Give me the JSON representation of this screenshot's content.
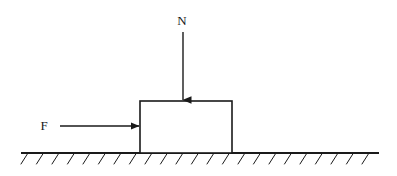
{
  "diagram": {
    "kind": "free-body-diagram",
    "background_color": "#ffffff",
    "stroke_color": "#1a1a1a",
    "labels": {
      "normal_force": "N",
      "applied_force": "F"
    },
    "block": {
      "name": "block",
      "x": 140,
      "y": 101,
      "width": 92,
      "height": 52,
      "fill": "#ffffff",
      "stroke_width": 1.6
    },
    "ground": {
      "name": "ground-line",
      "x_start": 22,
      "x_end": 378,
      "y": 153,
      "stroke_width": 2.0,
      "hatch": {
        "count": 23,
        "spacing": 15.5,
        "length": 13,
        "dx": -7,
        "dy": 11,
        "stroke_width": 1.0
      }
    },
    "arrows": [
      {
        "name": "normal-force-arrow",
        "label": "N",
        "direction": "down",
        "x1": 183,
        "y1": 32,
        "x2": 183,
        "y2": 100,
        "stroke_width": 1.4,
        "label_x": 182,
        "label_y": 25
      },
      {
        "name": "applied-force-arrow",
        "label": "F",
        "direction": "right",
        "x1": 60,
        "y1": 126,
        "x2": 139,
        "y2": 126,
        "stroke_width": 1.4,
        "label_x": 44,
        "label_y": 130
      }
    ]
  }
}
